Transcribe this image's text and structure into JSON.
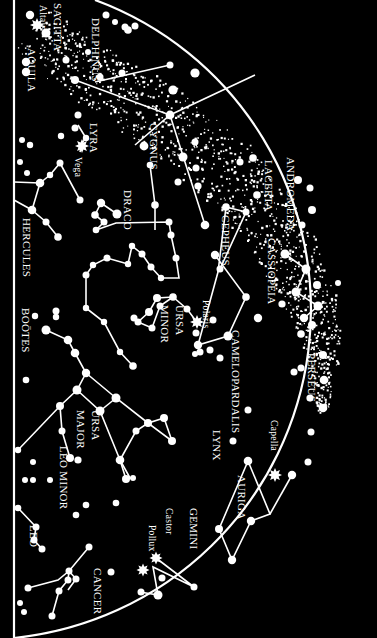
{
  "map": {
    "title": "Northern sky star chart",
    "colors": {
      "background": "#000000",
      "ink": "#ffffff"
    },
    "constellations": [
      {
        "id": "aquila",
        "label": "AQUILA"
      },
      {
        "id": "sagitta",
        "label": "SAGITTA"
      },
      {
        "id": "delphinus",
        "label": "DELPHINUS"
      },
      {
        "id": "lyra",
        "label": "LYRA"
      },
      {
        "id": "cygnus",
        "label": "CYGNUS"
      },
      {
        "id": "hercules",
        "label": "HERCULES"
      },
      {
        "id": "draco",
        "label": "DRACO"
      },
      {
        "id": "cepheus",
        "label": "CEPHEUS"
      },
      {
        "id": "lacerta",
        "label": "LACERTA"
      },
      {
        "id": "andromeda",
        "label": "ANDROMEDA"
      },
      {
        "id": "cassiopeia",
        "label": "CASSIOPEIA"
      },
      {
        "id": "ursa-minor-1",
        "label": "URSA"
      },
      {
        "id": "ursa-minor-2",
        "label": "MINOR"
      },
      {
        "id": "bootes",
        "label": "BOÖTES"
      },
      {
        "id": "camelopardalis",
        "label": "CAMELOPARDALIS"
      },
      {
        "id": "perseus",
        "label": "PERSEUS"
      },
      {
        "id": "ursa-major-1",
        "label": "URSA"
      },
      {
        "id": "ursa-major-2",
        "label": "MAJOR"
      },
      {
        "id": "leo-minor",
        "label": "LEO MINOR"
      },
      {
        "id": "lynx",
        "label": "LYNX"
      },
      {
        "id": "auriga",
        "label": "AURIGA"
      },
      {
        "id": "gemini",
        "label": "GEMINI"
      },
      {
        "id": "leo",
        "label": "LEO"
      },
      {
        "id": "cancer",
        "label": "CANCER"
      }
    ],
    "stars": [
      {
        "id": "altair",
        "label": "Altair"
      },
      {
        "id": "vega",
        "label": "Vega"
      },
      {
        "id": "polaris",
        "label": "Polaris"
      },
      {
        "id": "capella",
        "label": "Capella"
      },
      {
        "id": "castor",
        "label": "Castor"
      },
      {
        "id": "pollux",
        "label": "Pollux"
      }
    ]
  }
}
